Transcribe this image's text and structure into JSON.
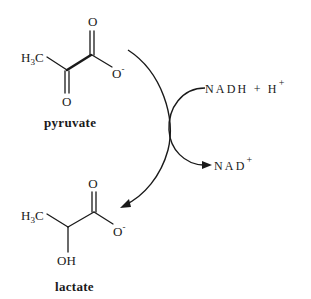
{
  "diagram": {
    "type": "biochemical-reaction",
    "colors": {
      "ink": "#1a1a1a",
      "background": "#ffffff"
    },
    "substrate": {
      "name": "pyruvate",
      "atoms": {
        "methyl_h": "H",
        "methyl_sub": "3",
        "methyl_c": "C",
        "carbonyl_o": "O",
        "keto_o": "O",
        "carboxylate_o": "O",
        "carboxylate_charge": "-"
      }
    },
    "product": {
      "name": "lactate",
      "atoms": {
        "methyl_h": "H",
        "methyl_sub": "3",
        "methyl_c": "C",
        "carbonyl_o": "O",
        "hydroxyl": "OH",
        "carboxylate_o": "O",
        "carboxylate_charge": "-"
      }
    },
    "cofactor_in": {
      "text": "NADH + H",
      "charge": "+"
    },
    "cofactor_out": {
      "text": "NAD",
      "charge": "+"
    },
    "arrows": [
      {
        "name": "main-reaction-arrow",
        "from": "pyruvate",
        "to": "lactate"
      },
      {
        "name": "cofactor-arrow",
        "from": "NADH + H+",
        "to": "NAD+"
      }
    ]
  }
}
